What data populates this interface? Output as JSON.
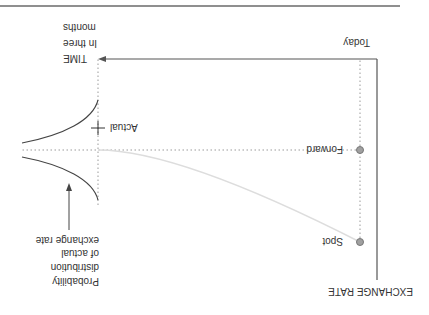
{
  "figure": {
    "orientation": "rotated 180 degrees",
    "y_axis_label": "EXCHANGE RATE",
    "x_axis": {
      "start_label": "Today",
      "end_label_lines": [
        "TIME",
        "In three",
        "months"
      ]
    },
    "points": {
      "forward": "Forward",
      "spot": "Spot",
      "actual": "Actual"
    },
    "distribution_label_lines": [
      "Probability",
      "distribution",
      "of actual",
      "exchange rate"
    ],
    "colors": {
      "text": "#333333",
      "axis": "#555555",
      "dotted_guides": "#9a9a9a",
      "expected_path": "#dddddd",
      "point_fill": "#a0a0a0"
    }
  }
}
